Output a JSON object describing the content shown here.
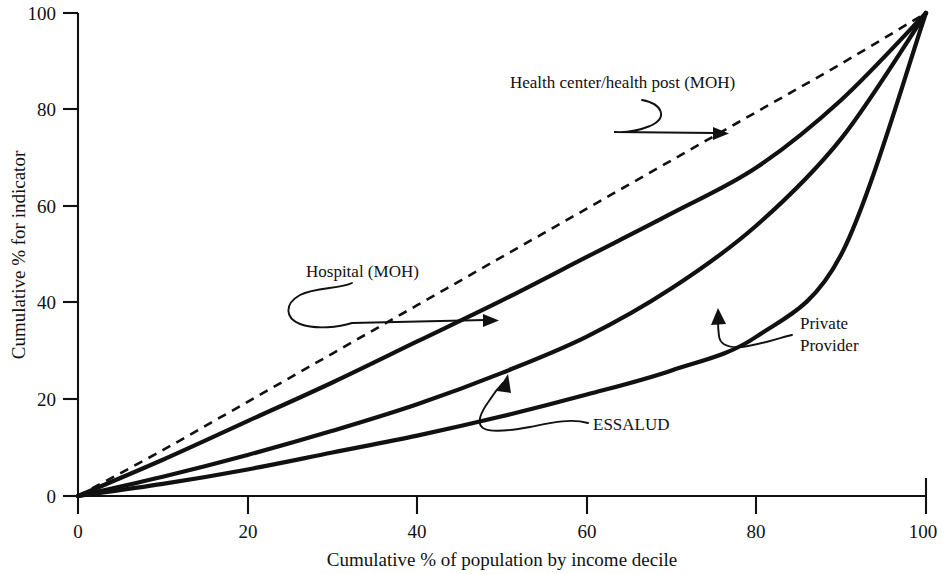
{
  "chart_data": {
    "type": "line",
    "title": "",
    "xlabel": "Cumulative % of population by income decile",
    "ylabel": "Cumulative % for indicator",
    "xlim": [
      0,
      100
    ],
    "ylim": [
      0,
      100
    ],
    "xticks": [
      "0",
      "20",
      "40",
      "60",
      "80",
      "100"
    ],
    "yticks": [
      "0",
      "20",
      "40",
      "60",
      "80",
      "100"
    ],
    "grid": false,
    "legend_position": "inline-annotations",
    "x": [
      0,
      10,
      20,
      30,
      40,
      50,
      60,
      70,
      80,
      90,
      100
    ],
    "series": [
      {
        "name": "Health center/health post (MOH)",
        "style": "dashed",
        "values": [
          0,
          9.5,
          19.5,
          29.5,
          39.5,
          49.5,
          59.5,
          69.5,
          79.5,
          89.5,
          100
        ]
      },
      {
        "name": "Hospital (MOH)",
        "style": "solid",
        "values": [
          0,
          7.5,
          15.5,
          23.5,
          32.0,
          40.5,
          49.5,
          58.5,
          68.0,
          82.0,
          100
        ]
      },
      {
        "name": "ESSALUD",
        "style": "solid",
        "values": [
          0,
          4.0,
          8.5,
          13.5,
          19.0,
          25.5,
          33.0,
          43.0,
          56.0,
          74.0,
          100
        ]
      },
      {
        "name": "Private Provider",
        "style": "solid",
        "values": [
          0,
          2.5,
          5.5,
          9.0,
          12.5,
          16.5,
          21.0,
          26.0,
          33.0,
          50.0,
          100
        ]
      }
    ],
    "annotations": [
      {
        "id": "hc-mop",
        "text": "Health center/health post (MOH)",
        "points_to": "Health center/health post (MOH)"
      },
      {
        "id": "hospital",
        "text": "Hospital (MOH)",
        "points_to": "Hospital (MOH)"
      },
      {
        "id": "essalud",
        "text": "ESSALUD",
        "points_to": "ESSALUD"
      },
      {
        "id": "private",
        "text_line1": "Private",
        "text_line2": "Provider",
        "points_to": "Private Provider"
      }
    ],
    "colors": {
      "line": "#111111",
      "background": "#ffffff"
    }
  },
  "axes": {
    "x_title": "Cumulative % of population by income decile",
    "y_title": "Cumulative % for indicator",
    "x_tick_labels": [
      "0",
      "20",
      "40",
      "60",
      "80",
      "100"
    ],
    "y_tick_labels": [
      "0",
      "20",
      "40",
      "60",
      "80",
      "100"
    ]
  },
  "labels": {
    "health_center": "Health center/health post (MOH)",
    "hospital": "Hospital (MOH)",
    "essalud": "ESSALUD",
    "private_line1": "Private",
    "private_line2": "Provider"
  }
}
